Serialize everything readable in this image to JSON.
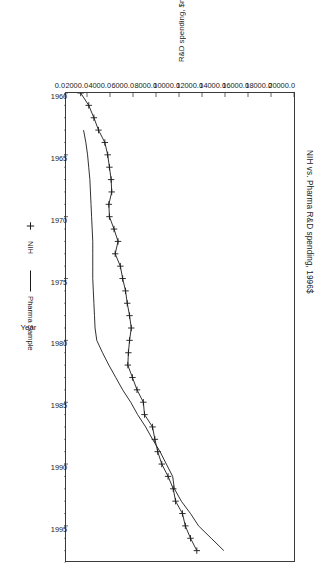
{
  "chart_data": {
    "type": "line",
    "title": "NIH vs. Pharma R&D spending, 1996$",
    "xlabel": "Year",
    "ylabel": "R&D spending, $m, 1996 $m",
    "xlim": [
      1960,
      1998
    ],
    "ylim": [
      0,
      20000
    ],
    "grid": false,
    "legend_position": "bottom",
    "orientation": "rotated-90-clockwise",
    "xticks": [
      "1960",
      "1965",
      "1970",
      "1975",
      "1980",
      "1985",
      "1990",
      "1995"
    ],
    "xtick_values": [
      1960,
      1965,
      1970,
      1975,
      1980,
      1985,
      1990,
      1995
    ],
    "yticks": [
      "0.0",
      "2000.0",
      "4000.0",
      "6000.0",
      "8000.0",
      "10000.0",
      "12000.0",
      "14000.0",
      "16000.0",
      "18000.0",
      "20000.0"
    ],
    "ytick_values": [
      0,
      2000,
      4000,
      6000,
      8000,
      10000,
      12000,
      14000,
      16000,
      18000,
      20000
    ],
    "x": [
      1960,
      1961,
      1962,
      1963,
      1964,
      1965,
      1966,
      1967,
      1968,
      1969,
      1970,
      1971,
      1972,
      1973,
      1974,
      1975,
      1976,
      1977,
      1978,
      1979,
      1980,
      1981,
      1982,
      1983,
      1984,
      1985,
      1986,
      1987,
      1988,
      1989,
      1990,
      1991,
      1992,
      1993,
      1994,
      1995,
      1996,
      1997
    ],
    "series": [
      {
        "name": "NIH",
        "marker": "plus",
        "color": "#1a1a1a",
        "values": [
          1450,
          2150,
          2600,
          3000,
          3550,
          3800,
          3950,
          4100,
          4150,
          3900,
          3950,
          4350,
          4700,
          4450,
          4900,
          5100,
          5350,
          5500,
          5700,
          5850,
          5700,
          5600,
          5550,
          5950,
          6350,
          6900,
          7000,
          7700,
          7900,
          8150,
          8500,
          9050,
          9500,
          9700,
          10300,
          10550,
          11000,
          11550
        ]
      },
      {
        "name": "Pharma Sample",
        "marker": "none",
        "color": "#1a1a1a",
        "values": [
          null,
          null,
          null,
          1700,
          1900,
          2050,
          2150,
          2250,
          2300,
          2350,
          2400,
          2450,
          2500,
          2500,
          2500,
          2500,
          2550,
          2600,
          2650,
          2700,
          2850,
          3350,
          3900,
          4500,
          5100,
          5800,
          6400,
          7100,
          7700,
          8350,
          8900,
          9450,
          9600,
          10200,
          11000,
          11700,
          12800,
          13900
        ]
      }
    ]
  },
  "legend": {
    "entries": [
      {
        "label": "NIH",
        "marker": "plus-marker-icon"
      },
      {
        "label": "Pharma Sample",
        "marker": "line-swatch-icon"
      }
    ]
  }
}
